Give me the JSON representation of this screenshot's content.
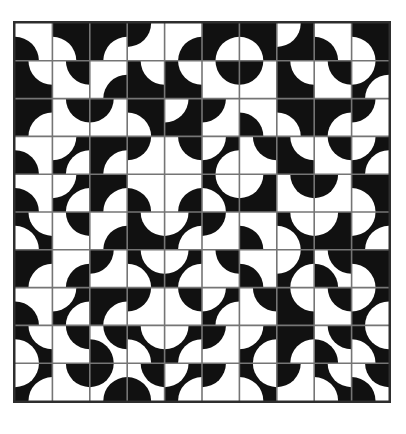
{
  "quilt": {
    "description": "black-and-white drunkards-path quarter-circle quilt pattern",
    "rows": 10,
    "cols": 10,
    "colors": {
      "black": "#111111",
      "white": "#ffffff",
      "grid_line": "#757575",
      "border": "#2e2e2e",
      "page_background": "#ffffff"
    },
    "disc_radius_ratio": 0.64,
    "tiles": [
      [
        [
          "W",
          [
            "BL"
          ]
        ],
        [
          "B",
          [
            "BL"
          ]
        ],
        [
          "B",
          [
            "BR"
          ]
        ],
        [
          "W",
          [
            "TL"
          ]
        ],
        [
          "W",
          [
            "BR"
          ]
        ],
        [
          "B",
          [
            "BR"
          ]
        ],
        [
          "B",
          [
            "BL"
          ]
        ],
        [
          "B",
          [
            "TL"
          ]
        ],
        [
          "W",
          [
            "BL"
          ]
        ],
        [
          "B",
          [
            "BL"
          ]
        ]
      ],
      [
        [
          "B",
          [
            "TR"
          ]
        ],
        [
          "W",
          [
            "TR"
          ]
        ],
        [
          "W",
          [
            "BR"
          ]
        ],
        [
          "B",
          [
            "TR"
          ]
        ],
        [
          "B",
          [
            "TR"
          ]
        ],
        [
          "W",
          [
            "TR"
          ]
        ],
        [
          "W",
          [
            "TL"
          ]
        ],
        [
          "B",
          [
            "TR"
          ]
        ],
        [
          "W",
          [
            "TR"
          ]
        ],
        [
          "B",
          [
            "TL",
            "BR"
          ]
        ]
      ],
      [
        [
          "B",
          [
            "BR"
          ]
        ],
        [
          "W",
          [
            "TR"
          ]
        ],
        [
          "W",
          [
            "TL"
          ]
        ],
        [
          "B",
          [
            "BL"
          ]
        ],
        [
          "B",
          [
            "TL"
          ]
        ],
        [
          "W",
          [
            "TL"
          ]
        ],
        [
          "W",
          [
            "BL"
          ]
        ],
        [
          "B",
          [
            "BL"
          ]
        ],
        [
          "B",
          [
            "BR"
          ]
        ],
        [
          "W",
          [
            "TL"
          ]
        ]
      ],
      [
        [
          "W",
          [
            "BL"
          ]
        ],
        [
          "B",
          [
            "TL",
            "BR"
          ]
        ],
        [
          "B",
          [
            "BR"
          ]
        ],
        [
          "W",
          [
            "TL"
          ]
        ],
        [
          "W",
          [
            "TR"
          ]
        ],
        [
          "B",
          [
            "TL",
            "BR"
          ]
        ],
        [
          "W",
          [
            "TR"
          ]
        ],
        [
          "B",
          [
            "TR"
          ]
        ],
        [
          "W",
          [
            "TR"
          ]
        ],
        [
          "B",
          [
            "TL",
            "BR"
          ]
        ]
      ],
      [
        [
          "W",
          [
            "BL"
          ]
        ],
        [
          "B",
          [
            "TL",
            "BR"
          ]
        ],
        [
          "B",
          [
            "BR"
          ]
        ],
        [
          "W",
          [
            "BL"
          ]
        ],
        [
          "W",
          [
            "BR"
          ]
        ],
        [
          "B",
          [
            "TR",
            "BL"
          ]
        ],
        [
          "B",
          [
            "TL"
          ]
        ],
        [
          "W",
          [
            "TR"
          ]
        ],
        [
          "W",
          [
            "TL"
          ]
        ],
        [
          "B",
          [
            "BL"
          ]
        ]
      ],
      [
        [
          "B",
          [
            "TR",
            "BL"
          ]
        ],
        [
          "W",
          [
            "TR"
          ]
        ],
        [
          "W",
          [
            "BR"
          ]
        ],
        [
          "B",
          [
            "TR"
          ]
        ],
        [
          "B",
          [
            "TL",
            "BR"
          ]
        ],
        [
          "W",
          [
            "TL"
          ]
        ],
        [
          "W",
          [
            "BL"
          ]
        ],
        [
          "B",
          [
            "BL",
            "TR"
          ]
        ],
        [
          "B",
          [
            "TL"
          ]
        ],
        [
          "B",
          [
            "TL",
            "BR"
          ]
        ]
      ],
      [
        [
          "B",
          [
            "BR"
          ]
        ],
        [
          "W",
          [
            "BR"
          ]
        ],
        [
          "W",
          [
            "TL"
          ]
        ],
        [
          "B",
          [
            "BL",
            "TR"
          ]
        ],
        [
          "B",
          [
            "TL",
            "BR"
          ]
        ],
        [
          "W",
          [
            "TR"
          ]
        ],
        [
          "W",
          [
            "BL"
          ]
        ],
        [
          "B",
          [
            "TL",
            "BR"
          ]
        ],
        [
          "W",
          [
            "BL",
            "TR"
          ]
        ],
        [
          "B",
          [
            "BL"
          ]
        ]
      ],
      [
        [
          "W",
          [
            "BL"
          ]
        ],
        [
          "B",
          [
            "TL",
            "BR"
          ]
        ],
        [
          "B",
          [
            "BR"
          ]
        ],
        [
          "W",
          [
            "TL"
          ]
        ],
        [
          "W",
          [
            "TR"
          ]
        ],
        [
          "B",
          [
            "TL",
            "BR"
          ]
        ],
        [
          "W",
          [
            "TR"
          ]
        ],
        [
          "B",
          [
            "TR"
          ]
        ],
        [
          "W",
          [
            "TR"
          ]
        ],
        [
          "B",
          [
            "TL",
            "BR"
          ]
        ]
      ],
      [
        [
          "B",
          [
            "TR",
            "BL"
          ]
        ],
        [
          "W",
          [
            "TR"
          ]
        ],
        [
          "W",
          [
            "BL",
            "TR"
          ]
        ],
        [
          "B",
          [
            "BL",
            "TR"
          ]
        ],
        [
          "B",
          [
            "TL",
            "BR"
          ]
        ],
        [
          "W",
          [
            "TL"
          ]
        ],
        [
          "B",
          [
            "TL",
            "BR"
          ]
        ],
        [
          "B",
          [
            "BR"
          ]
        ],
        [
          "W",
          [
            "TR",
            "BL"
          ]
        ],
        [
          "B",
          [
            "BL",
            "TR"
          ]
        ]
      ],
      [
        [
          "B",
          [
            "TL",
            "BR"
          ]
        ],
        [
          "W",
          [
            "TR"
          ]
        ],
        [
          "W",
          [
            "TL",
            "BR"
          ]
        ],
        [
          "W",
          [
            "BL",
            "TR"
          ]
        ],
        [
          "B",
          [
            "TL",
            "BR"
          ]
        ],
        [
          "W",
          [
            "TL"
          ]
        ],
        [
          "B",
          [
            "BL",
            "TR"
          ]
        ],
        [
          "W",
          [
            "TL"
          ]
        ],
        [
          "B",
          [
            "TR",
            "BL"
          ]
        ],
        [
          "W",
          [
            "BL",
            "TR"
          ]
        ]
      ]
    ]
  }
}
